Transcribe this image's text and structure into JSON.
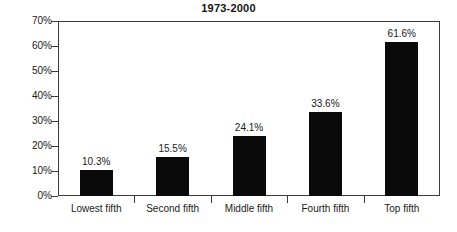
{
  "chart_data": {
    "type": "bar",
    "title": "1973-2000",
    "subtitle": "",
    "xlabel": "",
    "ylabel": "",
    "categories": [
      "Lowest fifth",
      "Second fifth",
      "Middle fifth",
      "Fourth fifth",
      "Top fifth"
    ],
    "values": [
      10.3,
      15.5,
      24.1,
      33.6,
      61.6
    ],
    "value_labels": [
      "10.3%",
      "15.5%",
      "24.1%",
      "33.6%",
      "61.6%"
    ],
    "ylim": [
      0,
      70
    ],
    "ytick_values": [
      0,
      10,
      20,
      30,
      40,
      50,
      60,
      70
    ],
    "ytick_labels": [
      "0%",
      "10%",
      "20%",
      "30%",
      "40%",
      "50%",
      "60%",
      "70%"
    ],
    "grid": false,
    "legend": null,
    "bar_color": "#0a0a0a",
    "axis_color": "#3a3a3a",
    "background_color": "#ffffff"
  }
}
